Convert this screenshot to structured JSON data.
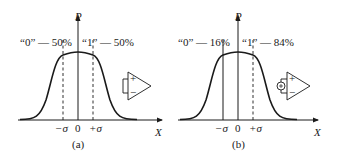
{
  "panels": [
    {
      "id": "a",
      "caption": "(a)",
      "y_axis_label": "P",
      "x_axis_label": "X",
      "left_annotation": "“0” — 50%",
      "right_annotation": "“1” — 50%",
      "tick_minus": "−σ",
      "tick_zero": "0",
      "tick_plus": "+σ",
      "threshold": "0",
      "amplifier_input": "short-circuit",
      "amp_plus": "+",
      "amp_minus": "−"
    },
    {
      "id": "b",
      "caption": "(b)",
      "y_axis_label": "P",
      "x_axis_label": "X",
      "left_annotation": "“0” — 16%",
      "right_annotation": "“1” — 84%",
      "tick_minus": "−σ",
      "tick_zero": "0",
      "tick_plus": "+σ",
      "threshold": "−σ",
      "amplifier_input": "offset voltage source",
      "amp_plus": "+",
      "amp_minus": "−"
    }
  ],
  "colors": {
    "ink": "#1a1a1a",
    "background": "#ffffff"
  }
}
